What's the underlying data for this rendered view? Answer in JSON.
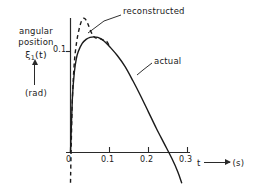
{
  "figure": {
    "y_caption_line1": "angular",
    "y_caption_line2": "position",
    "y_symbol": "ξ",
    "y_symbol_sub": "1",
    "y_symbol_arg": "(t)",
    "y_unit": "(rad)",
    "x_caption_variable": "t",
    "x_unit": "(s)",
    "ink_color": "#1a1a1a"
  },
  "chart_data": {
    "type": "line",
    "title": "",
    "xlabel": "t",
    "ylabel": "angular position ξ₁(t)",
    "x_unit": "s",
    "y_unit": "rad",
    "xlim": [
      0,
      0.31
    ],
    "ylim": [
      -0.035,
      0.145
    ],
    "xticks": [
      0,
      0.1,
      0.2,
      0.3
    ],
    "xtick_labels": [
      "0",
      "0.1",
      "0.2",
      "0.3"
    ],
    "yticks": [
      0.1
    ],
    "ytick_labels": [
      "0.1"
    ],
    "grid": false,
    "legend": "inline-annotations",
    "series": [
      {
        "name": "actual",
        "style": "solid",
        "label": "actual",
        "label_position": {
          "x": 0.195,
          "y": 0.113
        },
        "x": [
          0.0,
          0.005,
          0.01,
          0.015,
          0.02,
          0.03,
          0.04,
          0.05,
          0.06,
          0.07,
          0.08,
          0.09,
          0.1,
          0.12,
          0.14,
          0.16,
          0.18,
          0.2,
          0.22,
          0.24,
          0.26,
          0.275,
          0.285
        ],
        "y": [
          0.0,
          0.055,
          0.08,
          0.093,
          0.1,
          0.108,
          0.112,
          0.114,
          0.1145,
          0.114,
          0.112,
          0.109,
          0.105,
          0.096,
          0.085,
          0.071,
          0.056,
          0.04,
          0.024,
          0.009,
          -0.006,
          -0.019,
          -0.03
        ]
      },
      {
        "name": "reconstructed",
        "style": "dashed",
        "label": "reconstructed",
        "label_position": {
          "x": 0.115,
          "y": 0.142
        },
        "x": [
          0.0,
          0.002,
          0.005,
          0.01,
          0.016,
          0.022,
          0.028,
          0.034,
          0.04,
          0.046,
          0.052,
          0.058,
          0.064,
          0.07,
          0.078,
          0.086,
          0.094,
          0.1
        ],
        "y": [
          -0.03,
          0.01,
          0.055,
          0.09,
          0.11,
          0.122,
          0.13,
          0.133,
          0.131,
          0.126,
          0.12,
          0.1155,
          0.1135,
          0.1135,
          0.1125,
          0.111,
          0.1095,
          0.105
        ]
      }
    ]
  }
}
